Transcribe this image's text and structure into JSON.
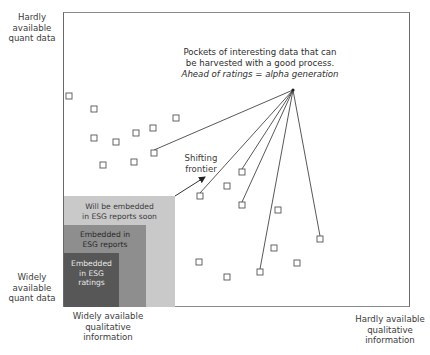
{
  "axes": {
    "y_top_label": [
      "Hardly",
      "available",
      "quant data"
    ],
    "y_bottom_label": [
      "Widely",
      "available",
      "quant data"
    ],
    "x_left_label": [
      "Widely available",
      "qualitative",
      "information"
    ],
    "x_right_label": [
      "Hardly available",
      "qualitative",
      "information"
    ]
  },
  "regions": [
    {
      "name": "will-be-embedded",
      "label": [
        "Will be embedded",
        "in ESG reports soon"
      ],
      "color": "#c9c9c9",
      "text_color": "#3a3a3a"
    },
    {
      "name": "embedded-reports",
      "label": [
        "Embedded in",
        "ESG reports"
      ],
      "color": "#8e8e8e",
      "text_color": "#2a2a2a"
    },
    {
      "name": "embedded-ratings",
      "label": [
        "Embedded",
        "in ESG",
        "ratings"
      ],
      "color": "#575757",
      "text_color": "#e8e8e8"
    }
  ],
  "frontier_label": [
    "Shifting",
    "frontier"
  ],
  "callout": {
    "line1": "Pockets of interesting data that can",
    "line2": "be harvested with a good process.",
    "line3": "Ahead of ratings = alpha generation"
  },
  "chart_data": {
    "type": "scatter",
    "title": "",
    "xlabel_left": "Widely available qualitative information",
    "xlabel_right": "Hardly available qualitative information",
    "ylabel_bottom": "Widely available quant data",
    "ylabel_top": "Hardly available quant data",
    "grid": false,
    "points_px": [
      [
        69,
        96
      ],
      [
        94,
        109
      ],
      [
        94,
        138
      ],
      [
        116,
        142
      ],
      [
        136,
        133
      ],
      [
        153,
        128
      ],
      [
        176,
        118
      ],
      [
        154,
        153
      ],
      [
        103,
        165
      ],
      [
        134,
        162
      ],
      [
        200,
        196
      ],
      [
        227,
        186
      ],
      [
        242,
        172
      ],
      [
        242,
        205
      ],
      [
        278,
        210
      ],
      [
        199,
        262
      ],
      [
        227,
        277
      ],
      [
        260,
        272
      ],
      [
        274,
        248
      ],
      [
        297,
        263
      ],
      [
        320,
        239
      ]
    ],
    "highlighted_points_px": [
      [
        154,
        153
      ],
      [
        200,
        196
      ],
      [
        242,
        172
      ],
      [
        242,
        205
      ],
      [
        260,
        272
      ],
      [
        320,
        239
      ]
    ],
    "callout_anchor_px": [
      293,
      90
    ],
    "frontier_arrow_px": {
      "from": [
        175,
        196
      ],
      "to": [
        205,
        177
      ]
    }
  }
}
